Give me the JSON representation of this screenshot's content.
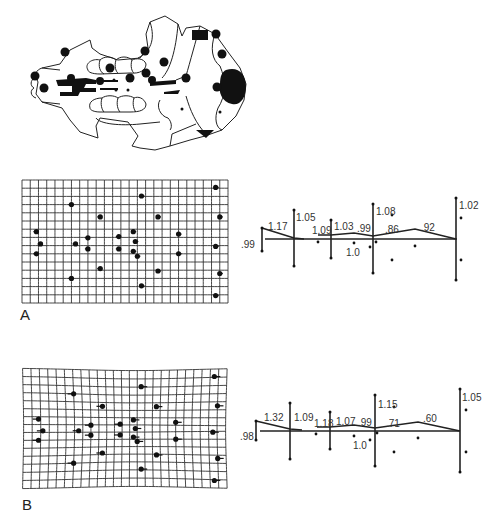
{
  "figure": {
    "panel_labels": [
      "A",
      "B"
    ],
    "skull": {
      "description": "ventral view of skull with landmark points",
      "landmark_count": 20
    },
    "panels": [
      {
        "label": "A",
        "grid": {
          "cols": 25,
          "rows": 15,
          "deformation": "slight"
        },
        "ratios": {
          "left_end": ".99",
          "seg1": "1.17",
          "bar1_top": "1.05",
          "seg2": "1.09",
          "seg3": "1.03",
          "seg4": ".99",
          "mid_low": "1.0",
          "bar3_top": "1.08",
          "seg5": ".86",
          "seg6": ".92",
          "right_top": "1.02"
        }
      },
      {
        "label": "B",
        "grid": {
          "cols": 25,
          "rows": 15,
          "deformation": "pronounced"
        },
        "ratios": {
          "left_end": ".98",
          "seg1": "1.32",
          "bar1_top": "1.09",
          "seg2": "1.18",
          "seg3": "1.07",
          "seg4": ".99",
          "mid_low": "1.0",
          "bar3_top": "1.15",
          "seg5": ".71",
          "seg6": ".60",
          "right_top": "1.05"
        }
      }
    ]
  }
}
